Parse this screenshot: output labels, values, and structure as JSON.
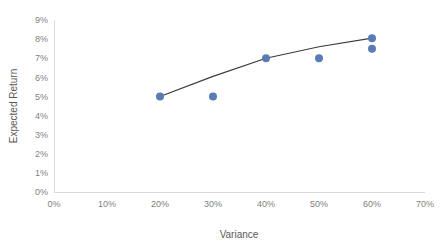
{
  "chart_data": {
    "type": "scatter",
    "title": "",
    "subtitle": "",
    "xlabel": "Variance",
    "ylabel": "Expected Return",
    "xlim": [
      0,
      70
    ],
    "ylim": [
      0,
      9
    ],
    "x_tick_labels": [
      "0%",
      "10%",
      "20%",
      "30%",
      "40%",
      "50%",
      "60%",
      "70%"
    ],
    "x_tick_values": [
      0,
      10,
      20,
      30,
      40,
      50,
      60,
      70
    ],
    "y_tick_labels": [
      "0%",
      "1%",
      "2%",
      "3%",
      "4%",
      "5%",
      "6%",
      "7%",
      "8%",
      "9%"
    ],
    "y_tick_values": [
      0,
      1,
      2,
      3,
      4,
      5,
      6,
      7,
      8,
      9
    ],
    "grid": false,
    "legend": "none",
    "marker_color": "#5b7bb4",
    "line_color": "#3a3a3a",
    "axis_color": "#d9d9d9",
    "tick_label_color": "#7f7f7f",
    "axis_title_color": "#595959",
    "series": [
      {
        "name": "Portfolios",
        "kind": "scatter",
        "points": [
          {
            "x": 20,
            "y": 5.0,
            "label": "20%, 5%"
          },
          {
            "x": 30,
            "y": 5.0,
            "label": "30%, 5%"
          },
          {
            "x": 40,
            "y": 7.0,
            "label": "40%, 7%"
          },
          {
            "x": 50,
            "y": 7.0,
            "label": "50%, 7%"
          },
          {
            "x": 60,
            "y": 8.05,
            "label": "60%, 8.05%"
          },
          {
            "x": 60,
            "y": 7.5,
            "label": "60%, 7.5%"
          }
        ]
      },
      {
        "name": "Efficient Frontier",
        "kind": "line",
        "points": [
          {
            "x": 20,
            "y": 5.0
          },
          {
            "x": 30,
            "y": 6.05
          },
          {
            "x": 40,
            "y": 7.0
          },
          {
            "x": 50,
            "y": 7.6
          },
          {
            "x": 60,
            "y": 8.05
          }
        ]
      }
    ]
  }
}
